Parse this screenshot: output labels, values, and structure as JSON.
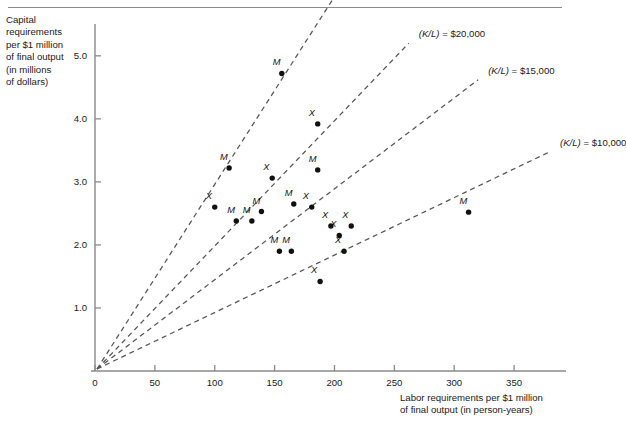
{
  "chart_data": {
    "type": "scatter",
    "title": "",
    "ylabel": "Capital requirements per $1 million of final output (in millions of dollars)",
    "xlabel": "Labor requirements per $1 million of final output (in person-years)",
    "xlim": [
      0,
      385
    ],
    "ylim": [
      0,
      5.6
    ],
    "grid": false,
    "legend_position": "inline-line-labels",
    "x_ticks": [
      0,
      50,
      100,
      150,
      200,
      250,
      300,
      350
    ],
    "x_tick_labels": [
      "0",
      "50",
      "100",
      "150",
      "200",
      "250",
      "300",
      "350"
    ],
    "y_ticks": [
      1.0,
      2.0,
      3.0,
      4.0,
      5.0
    ],
    "y_tick_labels": [
      "1.0",
      "2.0",
      "3.0",
      "4.0",
      "5.0"
    ],
    "series": [
      {
        "name": "M",
        "marker": "filled-circle",
        "point_label": "M",
        "points": [
          {
            "x": 156,
            "y": 4.72,
            "label": "M"
          },
          {
            "x": 112,
            "y": 3.22,
            "label": "M"
          },
          {
            "x": 118,
            "y": 2.38,
            "label": "M"
          },
          {
            "x": 131,
            "y": 2.38,
            "label": "M"
          },
          {
            "x": 139,
            "y": 2.53,
            "label": "M"
          },
          {
            "x": 166,
            "y": 2.65,
            "label": "M"
          },
          {
            "x": 186,
            "y": 3.19,
            "label": "M"
          },
          {
            "x": 154,
            "y": 1.9,
            "label": "M"
          },
          {
            "x": 164,
            "y": 1.9,
            "label": "M"
          },
          {
            "x": 312,
            "y": 2.52,
            "label": "M"
          }
        ]
      },
      {
        "name": "X",
        "marker": "filled-circle",
        "point_label": "X",
        "points": [
          {
            "x": 186,
            "y": 3.92,
            "label": "X"
          },
          {
            "x": 100,
            "y": 2.6,
            "label": "X"
          },
          {
            "x": 148,
            "y": 3.06,
            "label": "X"
          },
          {
            "x": 181,
            "y": 2.6,
            "label": "X"
          },
          {
            "x": 197,
            "y": 2.3,
            "label": "X"
          },
          {
            "x": 204,
            "y": 2.15,
            "label": "X"
          },
          {
            "x": 214,
            "y": 2.3,
            "label": "X"
          },
          {
            "x": 208,
            "y": 1.9,
            "label": "X"
          },
          {
            "x": 188,
            "y": 1.42,
            "label": "X"
          }
        ]
      }
    ],
    "rays": [
      {
        "label_prefix": "(K/L)",
        "label_eq": "=",
        "label_value": "$30,000",
        "slope_text": "(K/L) = $30,000",
        "end_x": 198,
        "end_y": 5.88
      },
      {
        "label_prefix": "(K/L)",
        "label_eq": "=",
        "label_value": "$20,000",
        "slope_text": "(K/L) = $20,000",
        "end_x": 262,
        "end_y": 5.2
      },
      {
        "label_prefix": "(K/L)",
        "label_eq": "=",
        "label_value": "$15,000",
        "slope_text": "(K/L) = $15,000",
        "end_x": 320,
        "end_y": 4.62
      },
      {
        "label_prefix": "(K/L)",
        "label_eq": "=",
        "label_value": "$10,000",
        "slope_text": "(K/L) = $10,000",
        "end_x": 380,
        "end_y": 3.48
      }
    ]
  },
  "axis": {
    "y_caption_lines": [
      "Capital",
      "requirements",
      "per $1 million",
      "of final output",
      "(in millions",
      "of dollars)"
    ],
    "x_caption_lines": [
      "Labor requirements per $1 million",
      "of final output (in person-years)"
    ]
  },
  "colors": {
    "axis": "#8a8a8a",
    "marker": "#111111",
    "dash": "#555555",
    "text": "#1a1a1a"
  }
}
